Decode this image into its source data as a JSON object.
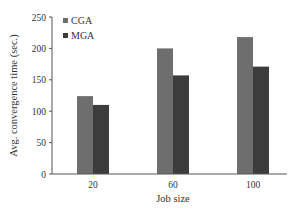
{
  "chart_data": {
    "type": "bar",
    "title": "",
    "xlabel": "Job size",
    "ylabel": "Avg. convergence time (sec.)",
    "categories": [
      "20",
      "60",
      "100"
    ],
    "series": [
      {
        "name": "CGA",
        "color": "#6e6e6e",
        "values": [
          124,
          200,
          218
        ]
      },
      {
        "name": "MGA",
        "color": "#3c3c3c",
        "values": [
          110,
          157,
          171
        ]
      }
    ],
    "ylim": [
      0,
      250
    ],
    "yticks": [
      0,
      50,
      100,
      150,
      200,
      250
    ],
    "ytick_labels": [
      "0",
      "50",
      "100",
      "150",
      "200",
      "250"
    ],
    "grid": false,
    "legend": {
      "placement": "top-left",
      "entries": [
        "CGA",
        "MGA"
      ]
    }
  }
}
